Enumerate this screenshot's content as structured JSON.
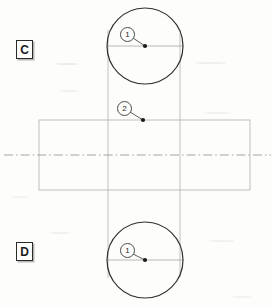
{
  "sheet": {
    "width": 273,
    "height": 307,
    "background_color": "#fdfdfc",
    "title": "Mechanical part orthographic views with balloon callouts"
  },
  "colors": {
    "outline_dark": "#2f2f2f",
    "construction_gray": "#a8a8a8",
    "centerline_gray": "#9a9a9a",
    "leader_gray": "#4a4a4a",
    "label_text": "#1c1c1c",
    "label_shadow": "#b8b8b8"
  },
  "view_labels": [
    {
      "id": "c",
      "text": "C",
      "x": 16,
      "y": 40
    },
    {
      "id": "d",
      "text": "D",
      "x": 16,
      "y": 242
    }
  ],
  "balloons": [
    {
      "id": "top-1",
      "text": "1",
      "cx": 127,
      "cy": 34,
      "dot_x": 145,
      "dot_y": 46
    },
    {
      "id": "mid-2",
      "text": "2",
      "cx": 124,
      "cy": 108,
      "dot_x": 143,
      "dot_y": 120
    },
    {
      "id": "bottom-1",
      "text": "1",
      "cx": 127,
      "cy": 250,
      "dot_x": 145,
      "dot_y": 260
    }
  ],
  "geometry": {
    "top_circle": {
      "cx": 145,
      "cy": 46,
      "r": 38
    },
    "bottom_circle": {
      "cx": 145,
      "cy": 260,
      "r": 38
    },
    "rectangle": {
      "x": 39,
      "y": 120,
      "width": 211,
      "height": 70
    },
    "vertical_projection_lines": [
      {
        "x": 108,
        "y1": 30,
        "y2": 278
      },
      {
        "x": 180,
        "y1": 30,
        "y2": 278
      }
    ],
    "horizontal_view_lines": [
      {
        "y": 46,
        "x1": 107,
        "x2": 183
      },
      {
        "y": 260,
        "x1": 107,
        "x2": 183
      }
    ],
    "centerline": {
      "y": 155,
      "x1": 4,
      "x2": 271,
      "style": "dash-dot"
    }
  }
}
